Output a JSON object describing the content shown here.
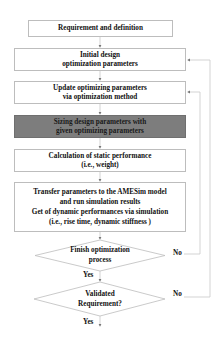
{
  "flowchart": {
    "title_mark": "",
    "steps": [
      {
        "id": "requirement",
        "lines": [
          "Requirement and definition"
        ],
        "highlight": false
      },
      {
        "id": "initial-design",
        "lines": [
          "Initial design",
          "optimization parameters"
        ],
        "highlight": false
      },
      {
        "id": "update-params",
        "lines": [
          "Update optimizing parameters",
          "via optimization method"
        ],
        "highlight": false
      },
      {
        "id": "sizing",
        "lines": [
          "Sizing design parameters with",
          "given optimizing parameters"
        ],
        "highlight": true
      },
      {
        "id": "static-calc",
        "lines": [
          "Calculation of static performance",
          "(i.e., weight)"
        ],
        "highlight": false
      },
      {
        "id": "amesim",
        "lines": [
          "Transfer parameters to the AMESim model",
          "and run simulation results",
          "Get of dynamic performances via simulation",
          "(i.e., rise time, dynamic stiffness )"
        ],
        "highlight": false
      }
    ],
    "decisions": [
      {
        "id": "finish-optimization",
        "lines": [
          "Finish optimization",
          "process"
        ],
        "yes_label": "Yes",
        "no_label": "No",
        "no_target": "update-params"
      },
      {
        "id": "validated-requirement",
        "lines": [
          "Validated",
          "Requirement?"
        ],
        "yes_label": "Yes",
        "no_label": "No",
        "no_target": "initial-design"
      }
    ],
    "colors": {
      "box_border": "#bdbdbd",
      "highlight_fill": "#7d7d7d",
      "line": "#c8c8c8",
      "text": "#111111"
    }
  }
}
